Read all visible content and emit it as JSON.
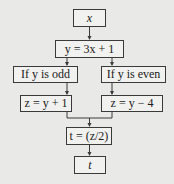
{
  "diagram": {
    "type": "flowchart",
    "nodes": {
      "x": {
        "label": "x"
      },
      "y": {
        "label": "y = 3x + 1"
      },
      "odd": {
        "label": "If y is odd"
      },
      "even": {
        "label": "If y is even"
      },
      "z_odd": {
        "label": "z = y + 1"
      },
      "z_even": {
        "label": "z = y − 4"
      },
      "t_calc": {
        "label": "t = (z/2)"
      },
      "t": {
        "label": "t"
      }
    },
    "edges": [
      [
        "x",
        "y"
      ],
      [
        "y",
        "odd"
      ],
      [
        "y",
        "even"
      ],
      [
        "odd",
        "z_odd"
      ],
      [
        "even",
        "z_even"
      ],
      [
        "z_odd",
        "t_calc"
      ],
      [
        "z_even",
        "t_calc"
      ],
      [
        "t_calc",
        "t"
      ]
    ],
    "colors": {
      "background": "#e9e9e7",
      "box_fill": "#f1f1ef",
      "stroke": "#3a3a3a"
    }
  }
}
